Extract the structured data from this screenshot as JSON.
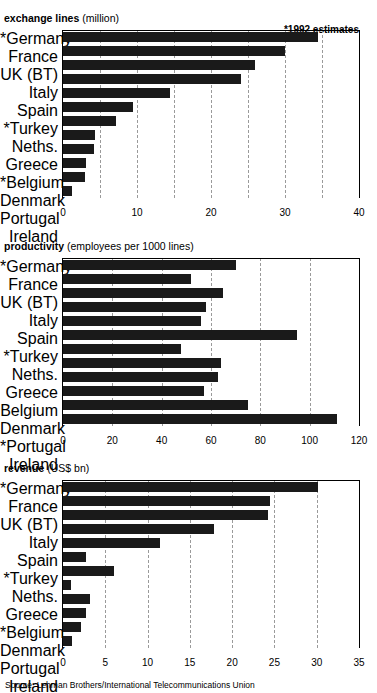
{
  "figure": {
    "source_note": "Source: Lehman Brothers/International Telecommunications Union",
    "estimate_note": "*1992 estimates",
    "cropped_title_fragment": ""
  },
  "chart_data": [
    {
      "type": "bar",
      "orientation": "horizontal",
      "title": "exchange lines",
      "subtitle": "(million)",
      "title_bold": "exchange lines",
      "title_unit": "(million)",
      "annotation": "*1992 estimates",
      "xlabel": "",
      "ylabel": "",
      "xlim": [
        0,
        40
      ],
      "xticks": [
        0,
        5,
        10,
        15,
        20,
        25,
        30,
        35,
        40
      ],
      "xticklabels": [
        "0",
        "",
        "10",
        "",
        "20",
        "",
        "30",
        "",
        "40"
      ],
      "grid": true,
      "legend": "none",
      "categories": [
        "*Germany",
        "France",
        "UK (BT)",
        "Italy",
        "Spain",
        "*Turkey",
        "Neths.",
        "Greece",
        "*Belgium",
        "Denmark",
        "Portugal",
        "Ireland"
      ],
      "values": [
        34.5,
        30.0,
        26.0,
        24.0,
        14.5,
        9.5,
        7.2,
        4.3,
        4.2,
        3.1,
        3.0,
        1.2
      ]
    },
    {
      "type": "bar",
      "orientation": "horizontal",
      "title": "productivity",
      "subtitle": "(employees per 1000 lines)",
      "title_bold": "productivity",
      "title_unit": "(employees per 1000 lines)",
      "annotation": "",
      "xlabel": "",
      "ylabel": "",
      "xlim": [
        0,
        120
      ],
      "xticks": [
        0,
        20,
        40,
        60,
        80,
        100,
        120
      ],
      "xticklabels": [
        "0",
        "20",
        "40",
        "60",
        "80",
        "100",
        "120"
      ],
      "grid": true,
      "legend": "none",
      "categories": [
        "*Germany",
        "France",
        "UK (BT)",
        "Italy",
        "Spain",
        "*Turkey",
        "Neths.",
        "Greece",
        "Belgium",
        "Denmark",
        "*Portugal",
        "Ireland"
      ],
      "values": [
        70,
        52,
        65,
        58,
        56,
        95,
        48,
        64,
        63,
        57,
        75,
        111
      ]
    },
    {
      "type": "bar",
      "orientation": "horizontal",
      "title": "revenue",
      "subtitle": "(US$ bn)",
      "title_bold": "revenue",
      "title_unit": "(US$ bn)",
      "annotation": "",
      "xlabel": "",
      "ylabel": "",
      "xlim": [
        0,
        35
      ],
      "xticks": [
        0,
        5,
        10,
        15,
        20,
        25,
        30,
        35
      ],
      "xticklabels": [
        "0",
        "5",
        "10",
        "15",
        "20",
        "25",
        "30",
        "35"
      ],
      "grid": true,
      "legend": "none",
      "categories": [
        "*Germany",
        "France",
        "UK (BT)",
        "Italy",
        "Spain",
        "*Turkey",
        "Neths.",
        "Greece",
        "*Belgium",
        "Denmark",
        "Portugal",
        "Ireland"
      ],
      "values": [
        30.2,
        24.5,
        24.2,
        17.8,
        11.5,
        2.7,
        6.0,
        1.0,
        3.2,
        2.7,
        2.1,
        1.1
      ]
    }
  ],
  "colors": {
    "bar": "#1a1a1a",
    "axis": "#000000",
    "grid": "#9a9a9a",
    "background": "#ffffff"
  }
}
